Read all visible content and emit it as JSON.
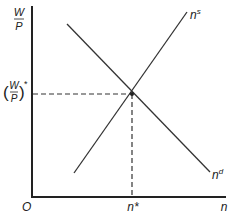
{
  "diagram": {
    "type": "labor-market-supply-demand",
    "y_axis_label": {
      "numerator": "W",
      "denominator": "P"
    },
    "x_axis_label": "n",
    "origin_label": "O",
    "equilibrium_wage_label": {
      "open": "(",
      "numerator": "W",
      "denominator": "P",
      "close": ")",
      "star": "*"
    },
    "equilibrium_quantity_label": "n*",
    "curves": [
      {
        "name": "supply",
        "label_base": "n",
        "label_sup": "s"
      },
      {
        "name": "demand",
        "label_base": "n",
        "label_sup": "d"
      }
    ],
    "colors": {
      "line": "#333333",
      "text": "#222222"
    }
  }
}
